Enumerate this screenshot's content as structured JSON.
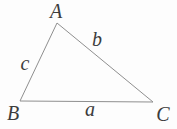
{
  "diagram": {
    "type": "triangle",
    "background_color": "#fdfdfd",
    "line_color": "#8f8f8f",
    "label_color": "#3c3c3c",
    "vertices": {
      "A": {
        "label": "A",
        "x": 57,
        "y": 23,
        "label_x": 56,
        "label_y": 18
      },
      "B": {
        "label": "B",
        "x": 20,
        "y": 101,
        "label_x": 13,
        "label_y": 120
      },
      "C": {
        "label": "C",
        "x": 153,
        "y": 102,
        "label_x": 163,
        "label_y": 121
      }
    },
    "sides": {
      "a": {
        "label": "a",
        "from": "B",
        "to": "C",
        "label_x": 90,
        "label_y": 116
      },
      "b": {
        "label": "b",
        "from": "A",
        "to": "C",
        "label_x": 97,
        "label_y": 46
      },
      "c": {
        "label": "c",
        "from": "A",
        "to": "B",
        "label_x": 25,
        "label_y": 70
      }
    }
  }
}
